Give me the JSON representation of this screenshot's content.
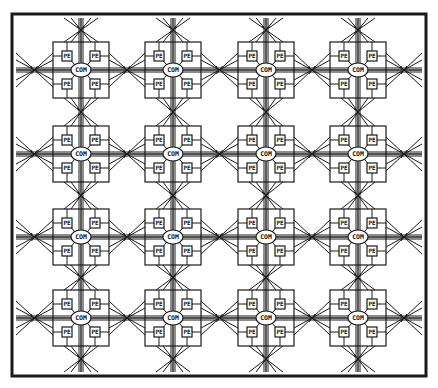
{
  "diagram": {
    "type": "processor-array",
    "rows": 4,
    "cols": 4,
    "frame": {
      "x": 12,
      "y": 14,
      "width": 414,
      "height": 362
    },
    "cell_size": 56,
    "col_centers": [
      81,
      173,
      266,
      358
    ],
    "row_centers": [
      70,
      154,
      237,
      318
    ],
    "colors": {
      "line": "#1a1a1a",
      "background": "#ffffff"
    },
    "labels": {
      "pe": "PE",
      "com": "COM",
      "switch_mark": "s/"
    },
    "cell_components": {
      "hub": "COM",
      "processing_elements": [
        "PE",
        "PE",
        "PE",
        "PE"
      ]
    }
  }
}
